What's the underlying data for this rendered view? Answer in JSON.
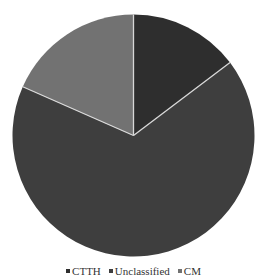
{
  "chart_data": {
    "type": "pie",
    "title": "",
    "categories": [
      "CTTH",
      "Unclassified",
      "CM"
    ],
    "values": [
      14.7,
      66.9,
      18.4
    ],
    "colors": [
      "#2e2e2e",
      "#3e3e3e",
      "#727272"
    ],
    "start_angle_deg": 0,
    "direction": "clockwise",
    "legend_position": "bottom",
    "separator_color": "#d8d8d8"
  },
  "legend": {
    "items": [
      {
        "label": "CTTH",
        "color": "#2e2e2e"
      },
      {
        "label": "Unclassified",
        "color": "#3e3e3e"
      },
      {
        "label": "CM",
        "color": "#727272"
      }
    ]
  }
}
